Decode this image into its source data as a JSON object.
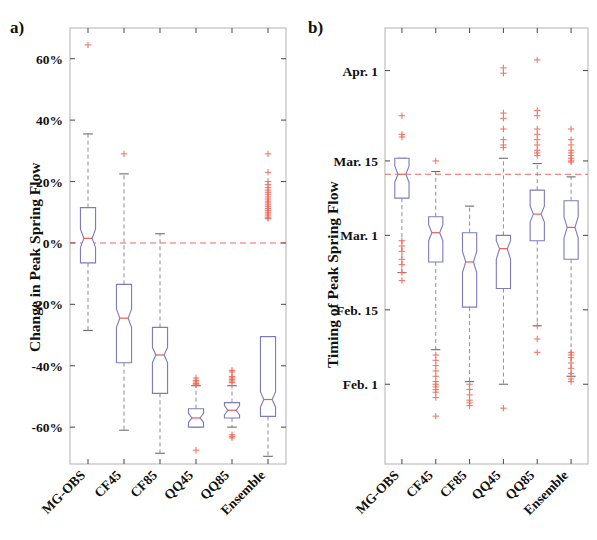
{
  "figure": {
    "panel_a_label": "a)",
    "panel_b_label": "b)",
    "categories": [
      "MG-OBS",
      "CF45",
      "CF85",
      "QQ45",
      "QQ85",
      "Ensemble"
    ]
  },
  "chart_data": [
    {
      "type": "box",
      "panel": "a",
      "title": "",
      "xlabel": "",
      "ylabel": "Change in Peak Spring Flow",
      "ylim": [
        -72,
        70
      ],
      "yticks": [
        60,
        40,
        20,
        0,
        -20,
        -40,
        -60
      ],
      "ytick_labels": [
        "60%",
        "40%",
        "20%",
        "0%",
        "-20%",
        "-40%",
        "-60%"
      ],
      "grid": false,
      "reference_line": 0,
      "reference_line_color": "#ef4b4b",
      "box_color": "#6a6ab5",
      "median_color": "#ef4b4b",
      "outlier_color": "#f4694f",
      "categories": [
        "MG-OBS",
        "CF45",
        "CF85",
        "QQ45",
        "QQ85",
        "Ensemble"
      ],
      "boxes": [
        {
          "name": "MG-OBS",
          "whisker_low": -28.5,
          "q1": -6.5,
          "median": 1.5,
          "q3": 11.5,
          "whisker_high": 35.5,
          "notch_low": -1.5,
          "notch_high": 4.5,
          "outliers": [
            64.5
          ]
        },
        {
          "name": "CF45",
          "whisker_low": -61.0,
          "q1": -39.0,
          "median": -24.5,
          "q3": -13.5,
          "whisker_high": 22.5,
          "notch_low": -27.5,
          "notch_high": -21.5,
          "outliers": [
            29.0
          ]
        },
        {
          "name": "CF85",
          "whisker_low": -68.5,
          "q1": -49.0,
          "median": -36.5,
          "q3": -27.5,
          "whisker_high": 3.0,
          "notch_low": -39.0,
          "notch_high": -34.0,
          "outliers": []
        },
        {
          "name": "QQ45",
          "whisker_low": -60.0,
          "q1": -60.0,
          "median": -57.0,
          "q3": -54.0,
          "whisker_high": -46.5,
          "notch_low": -58.5,
          "notch_high": -55.5,
          "outliers": [
            -44.0,
            -44.8,
            -45.3,
            -45.8,
            -46.2,
            -67.5
          ]
        },
        {
          "name": "QQ85",
          "whisker_low": -60.0,
          "q1": -57.0,
          "median": -54.5,
          "q3": -52.0,
          "whisker_high": -46.5,
          "notch_low": -56.0,
          "notch_high": -53.0,
          "outliers": [
            -41.5,
            -42.0,
            -43.5,
            -44.0,
            -44.5,
            -45.0,
            -45.5,
            -62.5,
            -63.0,
            -63.5
          ]
        },
        {
          "name": "Ensemble",
          "whisker_low": -69.5,
          "q1": -56.5,
          "median": -51.0,
          "q3": -30.5,
          "whisker_high": -30.5,
          "notch_low": -53.5,
          "notch_high": -48.5,
          "outliers": [
            29.0,
            23.0,
            20.0,
            19.0,
            18.0,
            17.2,
            16.5,
            15.8,
            15.0,
            14.3,
            13.6,
            13.0,
            12.4,
            11.8,
            11.2,
            10.6,
            10.0,
            9.4,
            8.8,
            8.2,
            8.0
          ]
        }
      ]
    },
    {
      "type": "box",
      "panel": "b",
      "title": "",
      "xlabel": "",
      "ylabel": "Timing of Peak Spring Flow",
      "ylim_days": [
        17,
        99
      ],
      "yticks_days": [
        91,
        74,
        60,
        46,
        32
      ],
      "ytick_labels": [
        "Apr. 1",
        "Mar. 15",
        "Mar. 1",
        "Feb. 15",
        "Feb. 1"
      ],
      "grid": false,
      "reference_line_days": 71.5,
      "reference_line_color": "#ef4b4b",
      "box_color": "#6a6ab5",
      "median_color": "#ef4b4b",
      "outlier_color": "#f4694f",
      "categories": [
        "MG-OBS",
        "CF45",
        "CF85",
        "QQ45",
        "QQ85",
        "Ensemble"
      ],
      "boxes": [
        {
          "name": "MG-OBS",
          "whisker_low": 53.0,
          "q1": 67.0,
          "median": 71.5,
          "q3": 74.5,
          "whisker_high": 74.5,
          "notch_low": 70.0,
          "notch_high": 73.0,
          "outliers": [
            82.5,
            79.0,
            78.5,
            59.0,
            58.0,
            57.0,
            55.5,
            54.5,
            53.0,
            51.5
          ]
        },
        {
          "name": "CF45",
          "whisker_low": 38.5,
          "q1": 55.0,
          "median": 60.5,
          "q3": 63.5,
          "whisker_high": 72.0,
          "notch_low": 59.0,
          "notch_high": 62.0,
          "outliers": [
            74.0,
            37.5,
            36.5,
            35.5,
            34.5,
            33.5,
            32.5,
            32.0,
            31.5,
            31.0,
            30.5,
            29.5,
            26.0
          ]
        },
        {
          "name": "CF85",
          "whisker_low": 32.5,
          "q1": 46.5,
          "median": 55.0,
          "q3": 60.5,
          "whisker_high": 65.5,
          "notch_low": 53.0,
          "notch_high": 57.0,
          "outliers": [
            32.0,
            31.0,
            30.0,
            29.0,
            28.5,
            28.0
          ]
        },
        {
          "name": "QQ45",
          "whisker_low": 32.0,
          "q1": 50.0,
          "median": 57.5,
          "q3": 60.0,
          "whisker_high": 74.5,
          "notch_low": 55.5,
          "notch_high": 59.0,
          "outliers": [
            91.5,
            90.5,
            83.0,
            82.0,
            80.0,
            78.0,
            77.0,
            76.5,
            27.5
          ]
        },
        {
          "name": "QQ85",
          "whisker_low": 43.0,
          "q1": 59.0,
          "median": 64.0,
          "q3": 68.5,
          "whisker_high": 73.5,
          "notch_low": 62.5,
          "notch_high": 65.5,
          "outliers": [
            93.0,
            83.5,
            82.5,
            80.0,
            79.0,
            78.0,
            77.0,
            76.0,
            75.5,
            75.0,
            43.0,
            40.5,
            38.0
          ]
        },
        {
          "name": "Ensemble",
          "whisker_low": 33.5,
          "q1": 55.5,
          "median": 61.5,
          "q3": 66.5,
          "whisker_high": 71.0,
          "notch_low": 59.5,
          "notch_high": 63.5,
          "outliers": [
            80.0,
            78.0,
            77.0,
            76.0,
            75.5,
            75.0,
            74.5,
            74.0,
            73.8,
            38.0,
            37.5,
            37.0,
            36.0,
            35.0,
            34.0,
            33.0,
            32.5
          ]
        }
      ]
    }
  ]
}
